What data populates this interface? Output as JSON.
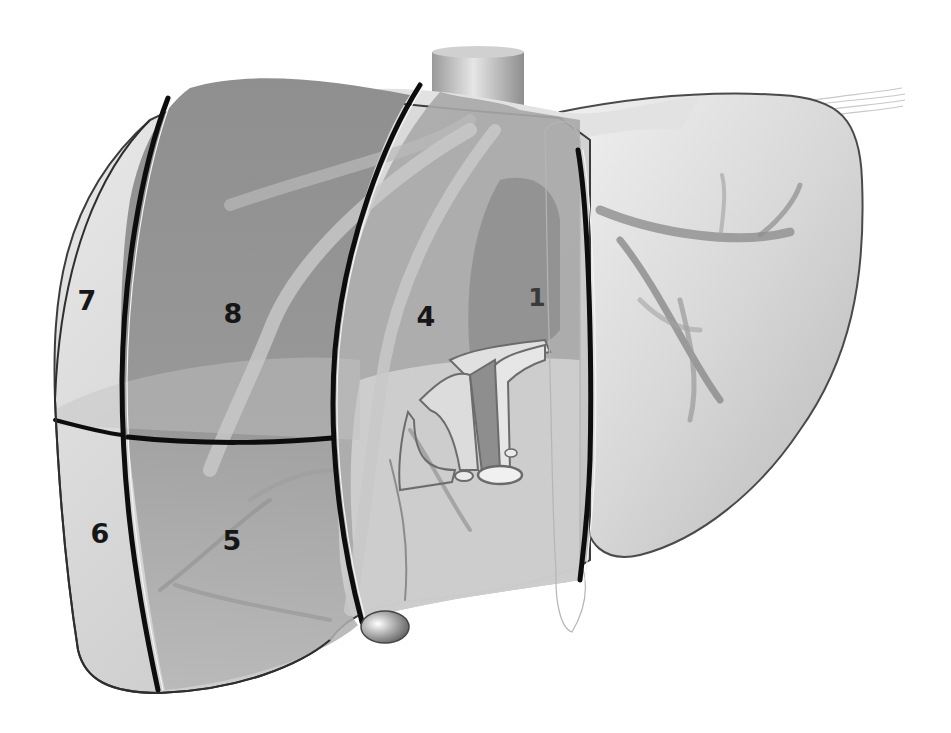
{
  "diagram": {
    "colors": {
      "background": "#ffffff",
      "liver_light": "#d6d6d6",
      "liver_mid": "#a9a9a9",
      "liver_dark": "#8a8a8a",
      "vessel": "#9c9c9c",
      "boundary_line": "#0d0d0d",
      "label": "#161616"
    },
    "segments": [
      {
        "id": "7",
        "label": "7",
        "x": 87,
        "y": 300
      },
      {
        "id": "8",
        "label": "8",
        "x": 233,
        "y": 313
      },
      {
        "id": "4",
        "label": "4",
        "x": 426,
        "y": 316
      },
      {
        "id": "1",
        "label": "1",
        "x": 537,
        "y": 297
      },
      {
        "id": "6",
        "label": "6",
        "x": 100,
        "y": 533
      },
      {
        "id": "5",
        "label": "5",
        "x": 232,
        "y": 540
      }
    ],
    "structures": [
      {
        "name": "inferior-vena-cava",
        "label": ""
      },
      {
        "name": "gallbladder",
        "label": ""
      },
      {
        "name": "portal-triad",
        "label": ""
      },
      {
        "name": "falciform-ligament",
        "label": ""
      },
      {
        "name": "left-lobe",
        "label": ""
      }
    ]
  }
}
